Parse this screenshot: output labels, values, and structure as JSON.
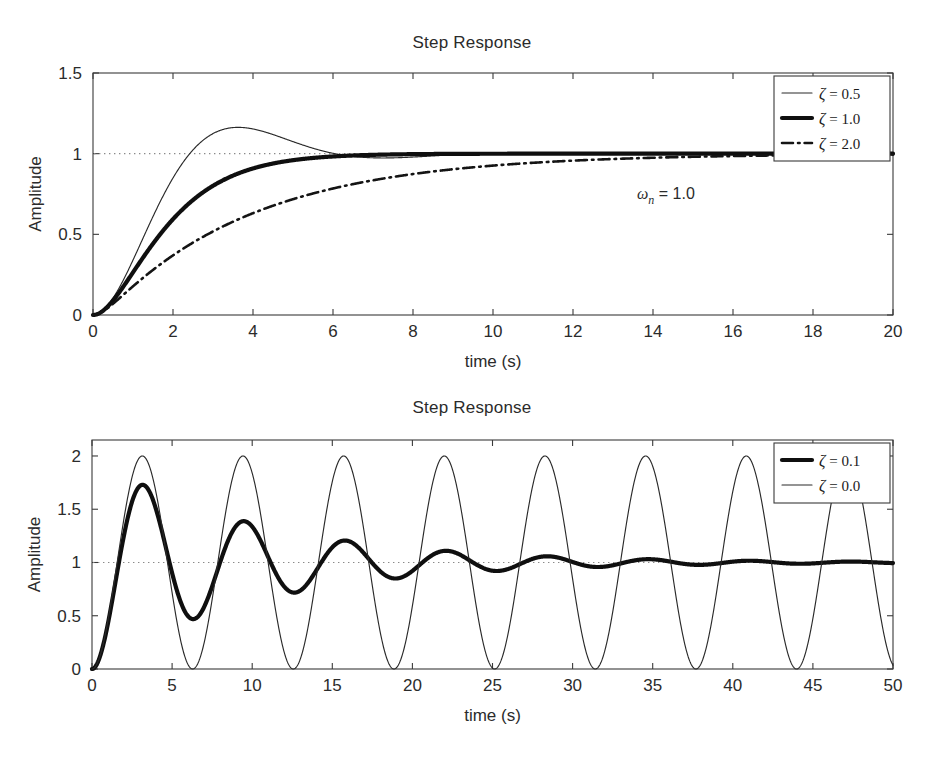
{
  "figure": {
    "background": "#ffffff",
    "ink_color": "#1a1a1a"
  },
  "chart_data": [
    {
      "id": "top",
      "type": "line",
      "title": "Step Response",
      "xlabel": "time (s)",
      "ylabel": "Amplitude",
      "xlim": [
        0,
        20
      ],
      "ylim": [
        0,
        1.5
      ],
      "xticks": [
        0,
        2,
        4,
        6,
        8,
        10,
        12,
        14,
        16,
        18,
        20
      ],
      "xticklabels": [
        "0",
        "2",
        "4",
        "6",
        "8",
        "10",
        "12",
        "14",
        "16",
        "18",
        "20"
      ],
      "yticks": [
        0,
        0.5,
        1,
        1.5
      ],
      "yticklabels": [
        "0",
        "0.5",
        "1",
        "1.5"
      ],
      "grid": false,
      "reference_line": {
        "y": 1,
        "style": "dotted"
      },
      "annotations": [
        {
          "text_symbol": "ω",
          "text_sub": "n",
          "text_value": " = 1.0",
          "x": 13.6,
          "y": 0.72
        }
      ],
      "legend": {
        "position": "upper right",
        "entries": [
          {
            "label_symbol": "ζ",
            "label": " = 0.5",
            "style": "thin",
            "zeta": 0.5
          },
          {
            "label_symbol": "ζ",
            "label": " = 1.0",
            "style": "thick",
            "zeta": 1.0
          },
          {
            "label_symbol": "ζ",
            "label": " = 2.0",
            "style": "dashdot",
            "zeta": 2.0
          }
        ]
      },
      "series": [
        {
          "name": "zeta = 0.5",
          "zeta": 0.5,
          "wn": 1.0,
          "style": "thin",
          "peak": {
            "t": 3.63,
            "value": 1.163
          }
        },
        {
          "name": "zeta = 1.0",
          "zeta": 1.0,
          "wn": 1.0,
          "style": "thick",
          "peak": {
            "t": 20,
            "value": 1.0
          }
        },
        {
          "name": "zeta = 2.0",
          "zeta": 2.0,
          "wn": 1.0,
          "style": "dashdot",
          "peak": {
            "t": 20,
            "value": 1.0
          }
        }
      ]
    },
    {
      "id": "bottom",
      "type": "line",
      "title": "Step Response",
      "xlabel": "time (s)",
      "ylabel": "Amplitude",
      "xlim": [
        0,
        50
      ],
      "ylim": [
        0,
        2.15
      ],
      "xticks": [
        0,
        5,
        10,
        15,
        20,
        25,
        30,
        35,
        40,
        45,
        50
      ],
      "xticklabels": [
        "0",
        "5",
        "10",
        "15",
        "20",
        "25",
        "30",
        "35",
        "40",
        "45",
        "50"
      ],
      "yticks": [
        0,
        0.5,
        1,
        1.5,
        2
      ],
      "yticklabels": [
        "0",
        "0.5",
        "1",
        "1.5",
        "2"
      ],
      "grid": false,
      "reference_line": {
        "y": 1,
        "style": "dotted"
      },
      "annotations": [],
      "legend": {
        "position": "upper right",
        "entries": [
          {
            "label_symbol": "ζ",
            "label": " = 0.1",
            "style": "thick",
            "zeta": 0.1
          },
          {
            "label_symbol": "ζ",
            "label": " = 0.0",
            "style": "thin",
            "zeta": 0.0
          }
        ]
      },
      "series": [
        {
          "name": "zeta = 0.1",
          "zeta": 0.1,
          "wn": 1.0,
          "style": "thick",
          "peak": {
            "t": 3.16,
            "value": 1.73
          }
        },
        {
          "name": "zeta = 0.0",
          "zeta": 0.0,
          "wn": 1.0,
          "style": "thin",
          "peak": {
            "t": 3.14,
            "value": 2.0
          }
        }
      ]
    }
  ]
}
